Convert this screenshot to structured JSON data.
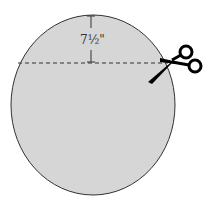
{
  "diagram": {
    "measurement_label": "7½\"",
    "shape": "circle",
    "cut_line": "dashed",
    "tool_icon": "scissors-icon",
    "colors": {
      "fill": "#d6d6d6",
      "stroke": "#333333",
      "dash": "#333333",
      "scissors": "#000000"
    }
  }
}
